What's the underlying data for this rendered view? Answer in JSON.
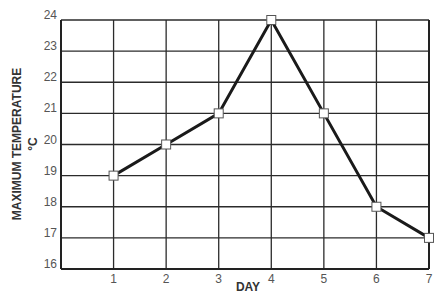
{
  "chart_data": {
    "type": "line",
    "title": "",
    "xlabel": "DAY",
    "ylabel": "MAXIMUM TEMPERATURE",
    "ylabel_unit": "°C",
    "x": [
      1,
      2,
      3,
      4,
      5,
      6,
      7
    ],
    "categories": [
      "1",
      "2",
      "3",
      "4",
      "5",
      "6",
      "7"
    ],
    "series": [
      {
        "name": "Maximum temperature",
        "values": [
          19,
          20,
          21,
          24,
          21,
          18,
          17
        ]
      }
    ],
    "xlim": [
      0,
      7
    ],
    "ylim": [
      16,
      24
    ],
    "yticks": [
      16,
      17,
      18,
      19,
      20,
      21,
      22,
      23,
      24
    ],
    "xticks": [
      1,
      2,
      3,
      4,
      5,
      6,
      7
    ],
    "grid": true,
    "legend": null,
    "marker": "square-open",
    "colors": {
      "line": "#1a1a1a",
      "grid": "#2b2b2b",
      "marker_fill": "#ffffff",
      "marker_stroke": "#555555"
    }
  }
}
